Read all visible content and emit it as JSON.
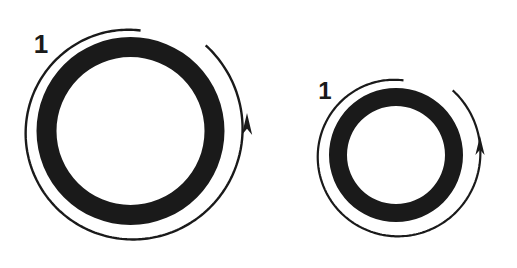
{
  "figure": {
    "background_color": "#ffffff",
    "ink_color": "#1a1a1a",
    "width": 517,
    "height": 268,
    "caption": ""
  },
  "objects": [
    {
      "id": "left",
      "name": "large-ring",
      "label": "1",
      "label_x": 41,
      "label_y": 46,
      "label_font_size": 26,
      "center_x": 130.5,
      "center_y": 131,
      "ring_outer_radius": 94,
      "ring_inner_radius": 74,
      "band_thickness": 20,
      "spiral_stroke_width": 2.4,
      "spiral_start_x": 137,
      "spiral_start_y": 18,
      "spiral_outer_radius": 114,
      "spiral_inner_radius": 101,
      "arrow_tip_x": 247,
      "arrow_tip_y": 113,
      "arrow_direction": "counterclockwise-up"
    },
    {
      "id": "right",
      "name": "small-ring",
      "label": "1",
      "label_x": 325,
      "label_y": 93,
      "label_font_size": 24,
      "center_x": 396,
      "center_y": 155,
      "ring_outer_radius": 67,
      "ring_inner_radius": 49,
      "band_thickness": 18,
      "spiral_stroke_width": 2.2,
      "spiral_start_x": 402,
      "spiral_start_y": 70,
      "spiral_outer_radius": 86,
      "spiral_inner_radius": 75,
      "arrow_tip_x": 480,
      "arrow_tip_y": 136,
      "arrow_direction": "counterclockwise-up"
    }
  ]
}
